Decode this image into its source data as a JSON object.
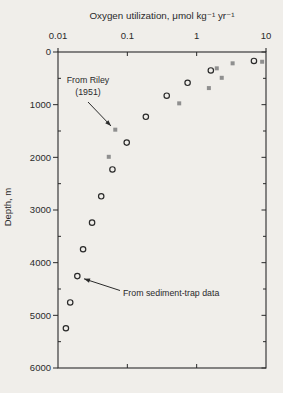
{
  "figure": {
    "background_color": "#f0eeea",
    "ink_color": "#2a2a2a"
  },
  "chart_data": {
    "type": "scatter",
    "title": "",
    "xlabel": "Oxygen utilization, μmol kg⁻¹ yr⁻¹",
    "ylabel": "Depth, m",
    "x_scale": "log",
    "xlim": [
      0.01,
      10
    ],
    "ylim": [
      0,
      6000
    ],
    "y_axis_inverted": true,
    "grid": false,
    "x_axis_position": "top",
    "x_ticks": [
      0.01,
      0.1,
      1,
      10
    ],
    "x_tick_labels": [
      "0.01",
      "0.1",
      "1",
      "10"
    ],
    "y_ticks": [
      0,
      1000,
      2000,
      3000,
      4000,
      5000,
      6000
    ],
    "y_tick_labels": [
      "0",
      "1000",
      "2000",
      "3000",
      "4000",
      "5000",
      "6000"
    ],
    "y_minor_ticks": [
      500,
      1500,
      2500,
      3500,
      4500,
      5500
    ],
    "series": [
      {
        "name": "From Riley (1951)",
        "marker": "filled-square",
        "color": "#8f8f8f",
        "points": [
          [
            8.8,
            185
          ],
          [
            3.3,
            215
          ],
          [
            1.95,
            310
          ],
          [
            2.3,
            490
          ],
          [
            1.5,
            685
          ],
          [
            0.56,
            975
          ],
          [
            0.067,
            1475
          ],
          [
            0.054,
            1990
          ]
        ]
      },
      {
        "name": "From sediment-trap data",
        "marker": "open-circle",
        "color": "#2a2a2a",
        "points": [
          [
            6.7,
            170
          ],
          [
            1.6,
            350
          ],
          [
            0.74,
            585
          ],
          [
            0.37,
            830
          ],
          [
            0.185,
            1230
          ],
          [
            0.098,
            1720
          ],
          [
            0.061,
            2230
          ],
          [
            0.042,
            2740
          ],
          [
            0.031,
            3240
          ],
          [
            0.023,
            3745
          ],
          [
            0.019,
            4255
          ],
          [
            0.015,
            4755
          ],
          [
            0.013,
            5245
          ]
        ]
      }
    ],
    "annotations": [
      {
        "lines": [
          "From Riley",
          "(1951)"
        ],
        "points_to": "square at 0.067, 1475 m"
      },
      {
        "lines": [
          "From sediment-trap data"
        ],
        "points_to": "circle at 0.019, 4255 m"
      }
    ]
  }
}
